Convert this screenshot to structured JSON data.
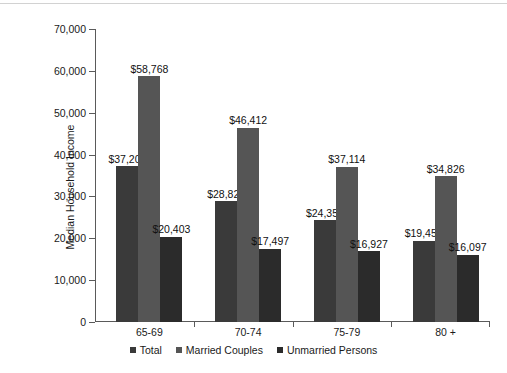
{
  "chart_data": {
    "type": "bar",
    "title": "",
    "xlabel": "",
    "ylabel": "Median Household Income",
    "categories": [
      "65-69",
      "70-74",
      "75-79",
      "80 +"
    ],
    "ylim": [
      0,
      70000
    ],
    "yticks": [
      0,
      10000,
      20000,
      30000,
      40000,
      50000,
      60000,
      70000
    ],
    "ytick_labels": [
      "0",
      "10,000",
      "20,000",
      "30,000",
      "40,000",
      "50,000",
      "60,000",
      "70,000"
    ],
    "grid": false,
    "legend_position": "bottom",
    "series": [
      {
        "name": "Total",
        "color": "#3a3a3a",
        "values": [
          37200,
          28820,
          24357,
          19457
        ],
        "labels": [
          "$37,200",
          "$28,820",
          "$24,357",
          "$19,457"
        ]
      },
      {
        "name": "Married Couples",
        "color": "#555555",
        "values": [
          58768,
          46412,
          37114,
          34826
        ],
        "labels": [
          "$58,768",
          "$46,412",
          "$37,114",
          "$34,826"
        ]
      },
      {
        "name": "Unmarried Persons",
        "color": "#2b2b2b",
        "values": [
          20403,
          17497,
          16927,
          16097
        ],
        "labels": [
          "$20,403",
          "$17,497",
          "$16,927",
          "$16,097"
        ]
      }
    ]
  },
  "axis": {
    "line_color": "#5a5a5a"
  },
  "legend": {
    "items": [
      {
        "label": "Total",
        "color": "#3a3a3a"
      },
      {
        "label": "Married Couples",
        "color": "#555555"
      },
      {
        "label": "Unmarried Persons",
        "color": "#2b2b2b"
      }
    ]
  }
}
